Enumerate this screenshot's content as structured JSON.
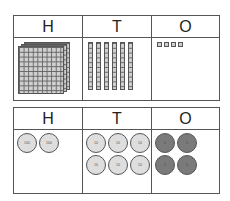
{
  "top_chart": {
    "headers": [
      "H",
      "T",
      "O"
    ],
    "hundreds_flats": 1,
    "tens_rods": 6,
    "ones_cubes": 4
  },
  "bottom_chart": {
    "headers": [
      "H",
      "T",
      "O"
    ],
    "hundreds_discs": [
      {
        "label": "100"
      },
      {
        "label": "100"
      }
    ],
    "tens_discs": [
      {
        "label": "10"
      },
      {
        "label": "10"
      },
      {
        "label": "10"
      },
      {
        "label": "10"
      },
      {
        "label": "10"
      },
      {
        "label": "10"
      }
    ],
    "ones_discs": [
      {
        "label": "1"
      },
      {
        "label": "1"
      },
      {
        "label": "1"
      },
      {
        "label": "1"
      }
    ]
  },
  "colors": {
    "border": "#555555",
    "block_fill": "#cfcfcf",
    "light_disc": "#dedede",
    "dark_disc": "#7a7a7a"
  }
}
